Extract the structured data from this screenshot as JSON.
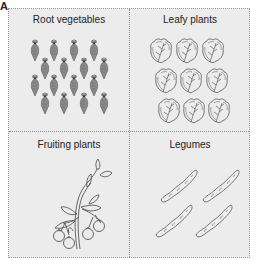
{
  "panel_label": "A",
  "quadrants": [
    {
      "title": "Root vegetables",
      "icon": "carrot-icon",
      "count": 16
    },
    {
      "title": "Leafy plants",
      "icon": "lettuce-leaf-icon",
      "count": 9
    },
    {
      "title": "Fruiting plants",
      "icon": "tomato-plant-icon",
      "count": 1
    },
    {
      "title": "Legumes",
      "icon": "pea-pod-icon",
      "count": 4
    }
  ],
  "colors": {
    "background": "#ececec",
    "border": "#9a9a9a",
    "carrot_fill": "#8a8a8a",
    "line_art": "#444444"
  }
}
